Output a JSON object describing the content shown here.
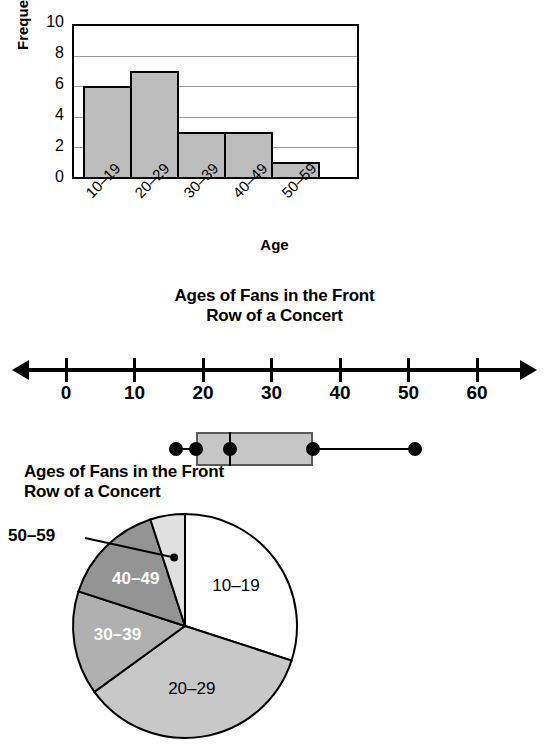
{
  "page": {
    "background": "#ffffff",
    "subject": "Ages of Fans in the Front Row of a Concert"
  },
  "histogram": {
    "title": "Row of a Concert",
    "title_clipped": true,
    "y_axis_label": "Frequency",
    "x_axis_label": "Age",
    "y_ticks": [
      "0",
      "2",
      "4",
      "6",
      "8",
      "10"
    ],
    "x_ticks": [
      "10–19",
      "20–29",
      "30–39",
      "40–49",
      "50–59"
    ],
    "bar_fill": "#bdbdbd",
    "bar_stroke": "#000000"
  },
  "boxplot": {
    "title_line1": "Ages of Fans in the Front",
    "title_line2": "Row of a Concert",
    "tick_labels": [
      "0",
      "10",
      "20",
      "30",
      "40",
      "50",
      "60"
    ],
    "box_fill": "#c6c6c6",
    "dot_color": "#000000"
  },
  "pie": {
    "title_line1": "Ages of Fans in the Front",
    "title_line2": "Row of a Concert",
    "callout_label": "50–59",
    "slice_labels": [
      "10–19",
      "20–29",
      "30–39",
      "40–49",
      "50–59"
    ]
  },
  "chart_data": [
    {
      "type": "bar",
      "name": "histogram-ages-of-fans",
      "title": "Ages of Fans in the Front Row of a Concert",
      "xlabel": "Age",
      "ylabel": "Frequency",
      "categories": [
        "10–19",
        "20–29",
        "30–39",
        "40–49",
        "50–59"
      ],
      "values": [
        6,
        7,
        3,
        3,
        1
      ],
      "ylim": [
        0,
        10
      ],
      "ytick_step": 2,
      "grid": true,
      "legend": "none",
      "bar_color": "#bdbdbd"
    },
    {
      "type": "boxplot",
      "name": "boxplot-ages-of-fans",
      "title": "Ages of Fans in the Front Row of a Concert",
      "xlabel": "",
      "axis_range": [
        0,
        60
      ],
      "tick_values": [
        0,
        10,
        20,
        30,
        40,
        50,
        60
      ],
      "minimum": 16,
      "q1": 19,
      "median": 24,
      "q3": 36,
      "maximum": 51,
      "grid": false,
      "legend": "none",
      "box_color": "#c6c6c6"
    },
    {
      "type": "pie",
      "name": "pie-ages-of-fans",
      "title": "Ages of Fans in the Front Row of a Concert",
      "labels": [
        "10–19",
        "20–29",
        "30–39",
        "40–49",
        "50–59"
      ],
      "values": [
        6,
        7,
        3,
        3,
        1
      ],
      "total": 20,
      "percentages": [
        30,
        35,
        15,
        15,
        5
      ],
      "angles_deg": [
        108,
        126,
        54,
        54,
        18
      ],
      "colors": [
        "#ffffff",
        "#c8c8c8",
        "#b0b0b0",
        "#949494",
        "#e0e0e0"
      ],
      "start_angle_deg": 0,
      "direction": "clockwise",
      "legend": "labels-on-slices",
      "callout": "50–59"
    }
  ]
}
